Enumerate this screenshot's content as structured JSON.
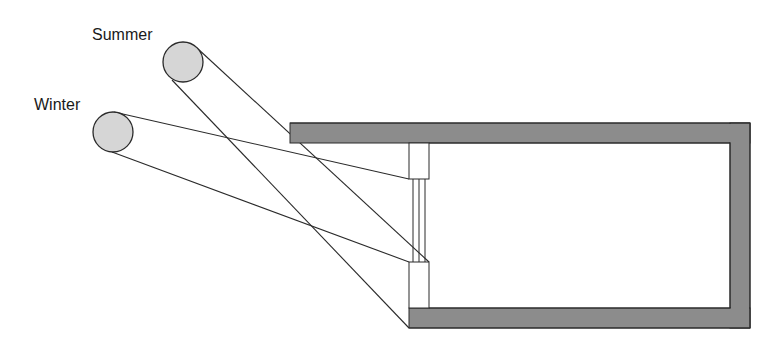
{
  "labels": {
    "summer": "Summer",
    "winter": "Winter"
  },
  "colors": {
    "sun_fill": "#d6d6d6",
    "wall_fill": "#8c8c8c",
    "stroke": "#2a2a2a",
    "background": "#ffffff"
  },
  "suns": [
    {
      "name": "summer",
      "cx": 183,
      "cy": 62,
      "r": 20
    },
    {
      "name": "winter",
      "cx": 113,
      "cy": 132,
      "r": 20
    }
  ]
}
